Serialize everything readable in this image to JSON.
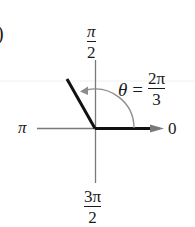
{
  "diagram": {
    "type": "polar-angle",
    "left_marker": ")",
    "axis_labels": {
      "top": {
        "numerator": "π",
        "denominator": "2"
      },
      "left": "π",
      "right": "0",
      "bottom": {
        "numerator": "3π",
        "denominator": "2"
      }
    },
    "angle_label": {
      "symbol": "θ",
      "equals": "=",
      "numerator": "2π",
      "denominator": "3"
    },
    "angle_radians": "2π/3",
    "colors": {
      "axis": "#7a7a7a",
      "terminal_ray": "#111111",
      "arc": "#8c8c8c",
      "text": "#1a1a1a"
    }
  }
}
